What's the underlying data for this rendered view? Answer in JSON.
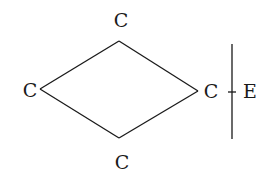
{
  "diagram": {
    "type": "molecular-structure",
    "nodes": [
      {
        "id": "top",
        "label": "C",
        "x": 121,
        "y": 27
      },
      {
        "id": "left",
        "label": "C",
        "x": 30,
        "y": 97
      },
      {
        "id": "right",
        "label": "C",
        "x": 210,
        "y": 97
      },
      {
        "id": "bottom",
        "label": "C",
        "x": 122,
        "y": 169
      },
      {
        "id": "e",
        "label": "E",
        "x": 250,
        "y": 97
      }
    ],
    "edges": [
      {
        "from": "top",
        "to": "left"
      },
      {
        "from": "left",
        "to": "bottom"
      },
      {
        "from": "bottom",
        "to": "right"
      },
      {
        "from": "right",
        "to": "top"
      },
      {
        "from": "right",
        "to": "e"
      }
    ],
    "separator": {
      "type": "vertical-line",
      "between": [
        "right",
        "e"
      ]
    },
    "colors": {
      "stroke": "#1a1a1a",
      "background": "#ffffff"
    }
  }
}
